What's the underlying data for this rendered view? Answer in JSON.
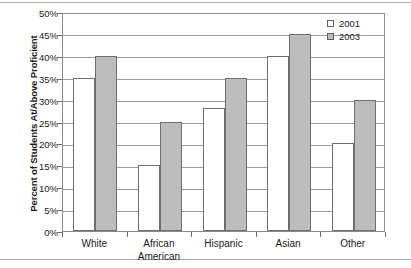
{
  "chart_data": {
    "type": "bar",
    "title": "",
    "xlabel": "",
    "ylabel": "Percent of Students At/Above Proficient",
    "ylim": [
      0,
      50
    ],
    "ytick_labels": [
      "0%",
      "5%",
      "10%",
      "15%",
      "20%",
      "25%",
      "30%",
      "35%",
      "40%",
      "45%",
      "50%"
    ],
    "ytick_values": [
      0,
      5,
      10,
      15,
      20,
      25,
      30,
      35,
      40,
      45,
      50
    ],
    "grid": true,
    "legend_position": "top-right",
    "categories": [
      "White",
      "African\nAmerican",
      "Hispanic",
      "Asian",
      "Other"
    ],
    "series": [
      {
        "name": "2001",
        "color": "#ffffff",
        "values": [
          35,
          15,
          28,
          40,
          20
        ]
      },
      {
        "name": "2003",
        "color": "#bdbdbd",
        "values": [
          40,
          25,
          35,
          45,
          30
        ]
      }
    ]
  },
  "legend": {
    "items": [
      {
        "label": "2001",
        "swatch": "legend-swatch-2001"
      },
      {
        "label": "2003",
        "swatch": "legend-swatch-2003"
      }
    ]
  }
}
